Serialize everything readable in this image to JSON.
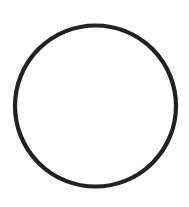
{
  "diagram": {
    "background": "#ffffff",
    "shapes": [
      {
        "type": "circle",
        "cx": 95.5,
        "cy": 106,
        "r": 80.5,
        "fill": "none",
        "stroke": "#222222",
        "stroke_width": 4.2
      }
    ]
  }
}
